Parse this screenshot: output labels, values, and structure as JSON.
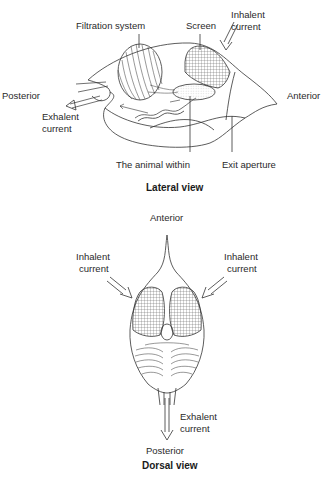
{
  "lateral": {
    "title": "Lateral view",
    "labels": {
      "filtration": "Filtration system",
      "screen": "Screen",
      "inhalent_1": "Inhalent",
      "inhalent_2": "current",
      "posterior": "Posterior",
      "anterior": "Anterior",
      "exhalent_1": "Exhalent",
      "exhalent_2": "current",
      "animal": "The animal within",
      "exit": "Exit aperture"
    }
  },
  "dorsal": {
    "title": "Dorsal view",
    "labels": {
      "anterior": "Anterior",
      "inhalent_left_1": "Inhalent",
      "inhalent_left_2": "current",
      "inhalent_right_1": "Inhalent",
      "inhalent_right_2": "current",
      "exhalent_1": "Exhalent",
      "exhalent_2": "current",
      "posterior": "Posterior"
    }
  },
  "colors": {
    "line": "#333333",
    "mesh": "#555555",
    "background": "#ffffff"
  }
}
